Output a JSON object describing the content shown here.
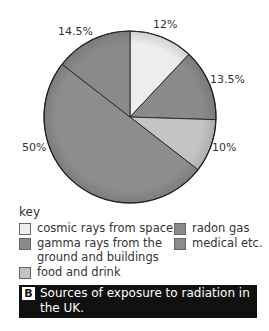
{
  "chart_data": {
    "type": "pie",
    "title": "Sources of exposure to radiation in the UK.",
    "figure_label": "B",
    "slices": [
      {
        "name": "cosmic rays from space",
        "value": 12,
        "label": "12%",
        "color": "#ededed"
      },
      {
        "name": "radon gas",
        "value": 13.5,
        "label": "13.5%",
        "color": "#8a8a8a"
      },
      {
        "name": "food and drink",
        "value": 10,
        "label": "10%",
        "color": "#c4c4c4"
      },
      {
        "name": "medical etc.",
        "value": 50,
        "label": "50%",
        "color": "#8d8d8d"
      },
      {
        "name": "gamma rays from the ground and buildings",
        "value": 14.5,
        "label": "14.5%",
        "color": "#8a8a8a"
      }
    ],
    "legend_title": "key",
    "legend_position": "bottom"
  },
  "labels": {
    "l12": "12%",
    "l135": "13.5%",
    "l10": "10%",
    "l50": "50%",
    "l145": "14.5%"
  },
  "key": {
    "title": "key",
    "items": [
      {
        "label": "cosmic rays from space",
        "color": "#ededed"
      },
      {
        "label": "gamma rays from the ground and buildings",
        "line1": "gamma rays from the",
        "line2": "ground and buildings",
        "color": "#8a8a8a"
      },
      {
        "label": "food and drink",
        "color": "#c4c4c4"
      },
      {
        "label": "radon gas",
        "color": "#8a8a8a"
      },
      {
        "label": "medical etc.",
        "color": "#8d8d8d"
      }
    ]
  },
  "caption": {
    "badge": "B",
    "text": "Sources of exposure to radiation in the UK."
  }
}
